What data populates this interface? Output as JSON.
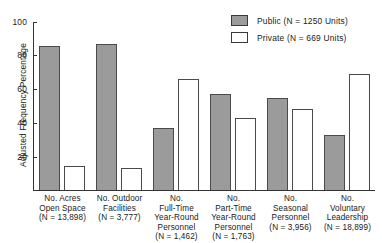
{
  "chart_data": {
    "type": "bar",
    "title": "",
    "xlabel": "",
    "ylabel": "Adjusted Frequency Percentage",
    "ylim": [
      0,
      100
    ],
    "yticks": [
      0,
      20,
      40,
      60,
      80,
      100
    ],
    "ytick_labels": [
      "",
      "20",
      "40",
      "60",
      "80",
      "100"
    ],
    "grid": false,
    "legend_position": "top-right",
    "categories": [
      "No. Acres\nOpen Space\n(N = 13,898)",
      "No. Outdoor\nFacilities\n(N = 3,777)",
      "No.\nFull-Time\nYear-Round\nPersonnel\n(N = 1,462)",
      "No.\nPart-Time\nYear-Round\nPersonnel\n(N = 1,763)",
      "No.\nSeasonal\nPersonnel\n(N = 3,956)",
      "No.\nVoluntary\nLeadership\n(N = 18,899)"
    ],
    "series": [
      {
        "name": "Public (N = 1250 Units)",
        "color": "#9b9b9b",
        "values": [
          86,
          87,
          37,
          57,
          55,
          33
        ]
      },
      {
        "name": "Private (N = 669 Units)",
        "color": "#ffffff",
        "values": [
          14,
          13,
          66,
          43,
          48,
          69
        ]
      }
    ]
  },
  "legend": {
    "items": [
      {
        "label": "Public (N = 1250 Units)",
        "swatch": "public"
      },
      {
        "label": "Private (N = 669 Units)",
        "swatch": "private"
      }
    ]
  },
  "axis": {
    "y_title": "Adjusted Frequency Percentage",
    "tick_100": "100",
    "tick_80": "80",
    "tick_60": "60",
    "tick_40": "40",
    "tick_20": "20"
  }
}
